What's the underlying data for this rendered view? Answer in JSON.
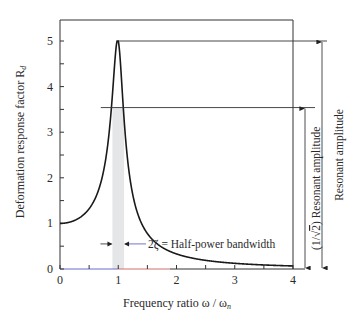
{
  "chart_data": {
    "type": "line",
    "title": "",
    "xlabel": "Frequency ratio ω / ω",
    "xlabel_sub": "n",
    "ylabel": "Deformation response factor R",
    "ylabel_sub": "d",
    "xlim": [
      0,
      4
    ],
    "ylim": [
      0,
      5.5
    ],
    "x_ticks": [
      0,
      1,
      2,
      3,
      4
    ],
    "x_tick_labels": [
      "0",
      "1",
      "2",
      "3",
      "4"
    ],
    "x_minor_ticks": [
      0.5,
      1.5,
      2.5,
      3.5
    ],
    "y_ticks": [
      0,
      1,
      2,
      3,
      4,
      5
    ],
    "y_tick_labels": [
      "0",
      "1",
      "2",
      "3",
      "4",
      "5"
    ],
    "y_minor_ticks": [
      0.5,
      1.5,
      2.5,
      3.5,
      4.5
    ],
    "grid": false,
    "series": [
      {
        "name": "Rd",
        "formula": "Rd = 1 / sqrt((1 - r^2)^2 + (2*zeta*r)^2)",
        "damping_ratio_zeta": 0.1,
        "peak": {
          "x": 1.0,
          "y": 5.0
        }
      }
    ],
    "annotations": {
      "resonant_amplitude": {
        "value": 5.0,
        "label": "Resonant amplitude"
      },
      "half_power_amplitude": {
        "value": 3.54,
        "label_prefix": "(1/",
        "label_sqrt": "2",
        "label_suffix": ") Resonant amplitude"
      },
      "half_power_band": {
        "x_from": 0.9,
        "x_to": 1.1
      },
      "bandwidth_label": "2ζ = Half-power bandwidth"
    },
    "colors": {
      "curve": "#1a1a1a",
      "band": "#e4e6e8",
      "axis": "#333333"
    }
  }
}
